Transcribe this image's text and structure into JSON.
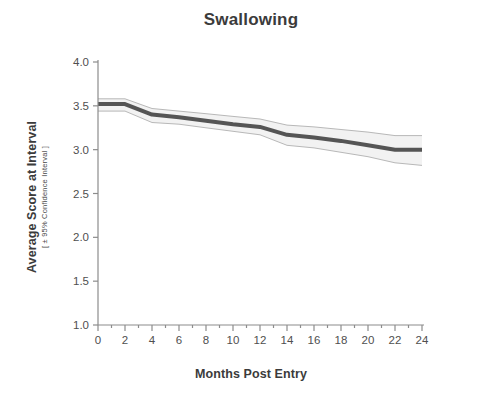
{
  "chart_data": {
    "type": "line",
    "title": "Swallowing",
    "xlabel": "Months Post Entry",
    "ylabel": "Average Score at Interval",
    "ylabel_sub": "[ ± 95% Confidence Interval ]",
    "xlim": [
      0,
      24
    ],
    "ylim": [
      1.0,
      4.0
    ],
    "grid": false,
    "legend": "none",
    "xticks": [
      0,
      2,
      4,
      6,
      8,
      10,
      12,
      14,
      16,
      18,
      20,
      22,
      24
    ],
    "xtick_labels": [
      "0",
      "2",
      "4",
      "6",
      "8",
      "10",
      "12",
      "14",
      "16",
      "18",
      "20",
      "22",
      "24"
    ],
    "yticks": [
      1.0,
      1.5,
      2.0,
      2.5,
      3.0,
      3.5,
      4.0
    ],
    "ytick_labels": [
      "1.0",
      "1.5",
      "2.0",
      "2.5",
      "3.0",
      "3.5",
      "4.0"
    ],
    "x": [
      0,
      2,
      4,
      6,
      8,
      10,
      12,
      14,
      16,
      18,
      20,
      22,
      24
    ],
    "series": [
      {
        "name": "Average Score at Interval",
        "values": [
          3.52,
          3.52,
          3.4,
          3.37,
          3.33,
          3.29,
          3.26,
          3.17,
          3.14,
          3.1,
          3.05,
          3.0,
          3.0
        ],
        "ci_upper": [
          3.58,
          3.58,
          3.47,
          3.44,
          3.41,
          3.38,
          3.35,
          3.28,
          3.26,
          3.23,
          3.2,
          3.16,
          3.16
        ],
        "ci_lower": [
          3.44,
          3.44,
          3.31,
          3.29,
          3.25,
          3.21,
          3.17,
          3.05,
          3.02,
          2.97,
          2.92,
          2.85,
          2.82
        ],
        "color": "#555555",
        "ci_fill": "#f2f2f2",
        "ci_edge": "#b8b8b8"
      }
    ],
    "axis_color": "#8c8c8c",
    "text_color": "#3b3b3b"
  }
}
